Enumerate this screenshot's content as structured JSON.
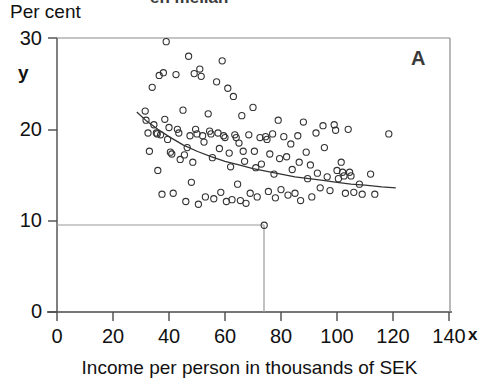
{
  "figure": {
    "panel_letter": "A",
    "clipped_title": "en mellan"
  },
  "axes": {
    "y_axis_title": "Per cent",
    "y_variable_symbol": "y",
    "x_variable_symbol": "x",
    "x_axis_title": "Income per person in thousands of SEK",
    "y_ticks": [
      "0",
      "10",
      "20",
      "30"
    ],
    "x_ticks": [
      "0",
      "20",
      "40",
      "60",
      "80",
      "100",
      "120",
      "140"
    ]
  },
  "chart_data": {
    "type": "scatter",
    "title": "",
    "xlabel": "Income per person in thousands of SEK",
    "ylabel": "Per cent",
    "xlim": [
      0,
      140
    ],
    "ylim": [
      0,
      30
    ],
    "xticks": [
      0,
      20,
      40,
      60,
      80,
      100,
      120,
      140
    ],
    "yticks": [
      0,
      10,
      20,
      30
    ],
    "grid": false,
    "legend": false,
    "annotations": [
      {
        "text": "A",
        "x": 129,
        "y": 28.1
      },
      {
        "text": "y",
        "x": -9,
        "y": 25.5
      },
      {
        "text": "x",
        "x": 147,
        "y": -1.4
      }
    ],
    "reference_lines": [
      {
        "orientation": "horizontal",
        "y": 9.5,
        "x_from": 0,
        "x_to": 74
      },
      {
        "orientation": "vertical",
        "x": 74,
        "y_from": 0,
        "y_to": 9.5
      }
    ],
    "series": [
      {
        "name": "Municipalities",
        "marker": "open-circle",
        "color": "#333333",
        "points": [
          [
            31.5,
            22.0
          ],
          [
            31.8,
            21.0
          ],
          [
            32.5,
            19.6
          ],
          [
            33.0,
            17.6
          ],
          [
            34.0,
            24.6
          ],
          [
            34.6,
            20.5
          ],
          [
            35.5,
            19.6
          ],
          [
            35.8,
            19.5
          ],
          [
            36.0,
            15.5
          ],
          [
            36.5,
            25.9
          ],
          [
            37.0,
            19.4
          ],
          [
            37.5,
            12.9
          ],
          [
            38.0,
            26.2
          ],
          [
            38.5,
            21.1
          ],
          [
            39.0,
            29.6
          ],
          [
            39.5,
            18.9
          ],
          [
            40.0,
            20.2
          ],
          [
            40.5,
            17.5
          ],
          [
            41.0,
            17.3
          ],
          [
            41.5,
            13.0
          ],
          [
            42.5,
            26.0
          ],
          [
            43.0,
            20.0
          ],
          [
            43.5,
            19.6
          ],
          [
            44.0,
            16.7
          ],
          [
            45.0,
            22.1
          ],
          [
            45.5,
            17.2
          ],
          [
            46.0,
            12.1
          ],
          [
            46.5,
            18.0
          ],
          [
            47.0,
            28.0
          ],
          [
            47.5,
            19.3
          ],
          [
            48.0,
            14.2
          ],
          [
            48.5,
            16.4
          ],
          [
            49.0,
            26.1
          ],
          [
            49.5,
            20.0
          ],
          [
            50.0,
            19.5
          ],
          [
            50.5,
            11.8
          ],
          [
            51.0,
            26.6
          ],
          [
            51.5,
            25.8
          ],
          [
            52.0,
            19.3
          ],
          [
            52.5,
            18.6
          ],
          [
            53.0,
            12.6
          ],
          [
            54.0,
            21.7
          ],
          [
            54.5,
            19.8
          ],
          [
            55.0,
            19.5
          ],
          [
            55.5,
            16.9
          ],
          [
            56.0,
            12.4
          ],
          [
            57.0,
            25.2
          ],
          [
            57.5,
            19.6
          ],
          [
            58.0,
            17.9
          ],
          [
            58.5,
            13.1
          ],
          [
            59.0,
            27.5
          ],
          [
            59.5,
            19.3
          ],
          [
            60.0,
            19.1
          ],
          [
            60.5,
            12.1
          ],
          [
            61.0,
            24.5
          ],
          [
            61.5,
            17.4
          ],
          [
            62.0,
            15.9
          ],
          [
            62.5,
            12.3
          ],
          [
            63.0,
            23.6
          ],
          [
            63.5,
            19.4
          ],
          [
            64.0,
            19.1
          ],
          [
            64.5,
            14.0
          ],
          [
            65.0,
            18.5
          ],
          [
            65.5,
            12.2
          ],
          [
            66.0,
            21.5
          ],
          [
            66.5,
            17.6
          ],
          [
            67.0,
            16.5
          ],
          [
            67.5,
            11.9
          ],
          [
            68.5,
            19.4
          ],
          [
            69.0,
            13.0
          ],
          [
            70.0,
            22.4
          ],
          [
            70.5,
            17.6
          ],
          [
            71.0,
            15.8
          ],
          [
            71.5,
            12.6
          ],
          [
            72.5,
            19.1
          ],
          [
            73.0,
            16.2
          ],
          [
            74.0,
            9.5
          ],
          [
            74.5,
            19.2
          ],
          [
            75.0,
            18.9
          ],
          [
            75.5,
            13.2
          ],
          [
            76.0,
            17.3
          ],
          [
            77.0,
            19.5
          ],
          [
            77.5,
            15.1
          ],
          [
            78.0,
            12.5
          ],
          [
            79.0,
            21.0
          ],
          [
            79.5,
            16.8
          ],
          [
            80.0,
            13.4
          ],
          [
            81.0,
            19.2
          ],
          [
            82.0,
            17.0
          ],
          [
            82.5,
            12.8
          ],
          [
            83.5,
            18.4
          ],
          [
            84.0,
            15.6
          ],
          [
            85.0,
            13.0
          ],
          [
            86.0,
            19.3
          ],
          [
            86.5,
            16.4
          ],
          [
            87.0,
            12.2
          ],
          [
            88.0,
            20.8
          ],
          [
            89.0,
            17.5
          ],
          [
            89.5,
            14.6
          ],
          [
            90.5,
            16.1
          ],
          [
            91.0,
            12.6
          ],
          [
            92.5,
            19.6
          ],
          [
            93.0,
            15.2
          ],
          [
            94.0,
            13.6
          ],
          [
            95.0,
            20.4
          ],
          [
            95.5,
            18.0
          ],
          [
            96.5,
            14.8
          ],
          [
            97.5,
            13.3
          ],
          [
            99.0,
            20.5
          ],
          [
            99.5,
            19.9
          ],
          [
            100.0,
            15.5
          ],
          [
            100.5,
            14.6
          ],
          [
            101.5,
            16.4
          ],
          [
            102.0,
            15.3
          ],
          [
            102.5,
            14.9
          ],
          [
            103.0,
            13.0
          ],
          [
            104.0,
            20.0
          ],
          [
            104.5,
            15.3
          ],
          [
            105.0,
            14.9
          ],
          [
            106.0,
            13.1
          ],
          [
            108.0,
            14.0
          ],
          [
            109.0,
            12.9
          ],
          [
            112.0,
            15.1
          ],
          [
            113.5,
            12.9
          ],
          [
            118.5,
            19.5
          ]
        ]
      }
    ],
    "fit_curve": {
      "name": "fitted regression curve",
      "color": "#333333",
      "points": [
        [
          28.5,
          21.9
        ],
        [
          32,
          20.9
        ],
        [
          36,
          20.0
        ],
        [
          40,
          19.2
        ],
        [
          45,
          18.3
        ],
        [
          50,
          17.6
        ],
        [
          55,
          17.0
        ],
        [
          60,
          16.5
        ],
        [
          65,
          16.1
        ],
        [
          70,
          15.7
        ],
        [
          75,
          15.4
        ],
        [
          80,
          15.1
        ],
        [
          85,
          14.8
        ],
        [
          90,
          14.6
        ],
        [
          95,
          14.4
        ],
        [
          100,
          14.2
        ],
        [
          105,
          14.0
        ],
        [
          110,
          13.9
        ],
        [
          116,
          13.7
        ],
        [
          121,
          13.6
        ]
      ]
    }
  }
}
